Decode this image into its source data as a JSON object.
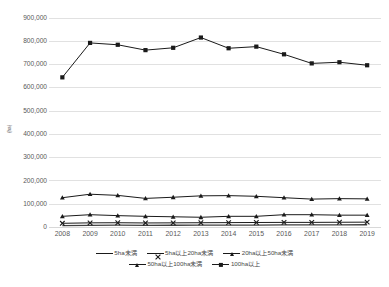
{
  "chart_data": {
    "type": "line",
    "title": "",
    "xlabel": "",
    "ylabel": "(ha)",
    "ylim": [
      0,
      900000
    ],
    "ytick_step": 100000,
    "grid": true,
    "legend_position": "bottom",
    "categories": [
      "2008",
      "2009",
      "2010",
      "2011",
      "2012",
      "2013",
      "2014",
      "2015",
      "2016",
      "2017",
      "2018",
      "2019"
    ],
    "yticks": [
      "0",
      "100,000",
      "200,000",
      "300,000",
      "400,000",
      "500,000",
      "600,000",
      "700,000",
      "800,000",
      "900,000"
    ],
    "series": [
      {
        "name": "5ha未満",
        "marker": "none",
        "color": "#404040",
        "values": [
          8000,
          9500,
          9800,
          9200,
          9600,
          9800,
          10200,
          10400,
          11000,
          11200,
          11500,
          11800
        ]
      },
      {
        "name": "5ha以上20ha未満",
        "marker": "x",
        "color": "#1a1a1a",
        "values": [
          18000,
          20000,
          20500,
          19500,
          20000,
          20500,
          21000,
          21500,
          22000,
          22000,
          22500,
          23000
        ]
      },
      {
        "name": "20ha以上50ha未満",
        "marker": "triangle",
        "color": "#1a1a1a",
        "values": [
          48000,
          55000,
          51000,
          48000,
          46000,
          44000,
          48000,
          48000,
          55000,
          55000,
          53000,
          53000
        ]
      },
      {
        "name": "50ha以上100ha未満",
        "marker": "triangle",
        "color": "#1a1a1a",
        "values": [
          128000,
          143000,
          138000,
          125000,
          130000,
          136000,
          137000,
          134000,
          128000,
          122000,
          124000,
          123000
        ]
      },
      {
        "name": "100ha以上",
        "marker": "square",
        "color": "#1a1a1a",
        "values": [
          645000,
          793000,
          785000,
          762000,
          772000,
          816000,
          770000,
          777000,
          744000,
          705000,
          710000,
          697000
        ]
      }
    ],
    "colors": {
      "line": "#1a1a1a",
      "grid": "#d4d4d4",
      "text": "#595959",
      "background": "#ffffff"
    }
  }
}
